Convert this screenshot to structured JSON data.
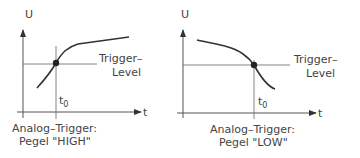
{
  "diagrams": [
    {
      "y_axis_label": "U",
      "x_axis_label": "t",
      "trigger_label_1": "Trigger–",
      "trigger_label_2": "Level",
      "t0_main": "t",
      "t0_sub": "0",
      "caption_1": "Analog–Trigger:",
      "caption_2": "Pegel \"HIGH\""
    },
    {
      "y_axis_label": "U",
      "x_axis_label": "t",
      "trigger_label_1": "Trigger–",
      "trigger_label_2": "Level",
      "t0_main": "t",
      "t0_sub": "0",
      "caption_1": "Analog–Trigger:",
      "caption_2": "Pegel \"LOW\""
    }
  ],
  "colors": {
    "line": "#333333",
    "text": "#444444",
    "thin": "#555555"
  }
}
